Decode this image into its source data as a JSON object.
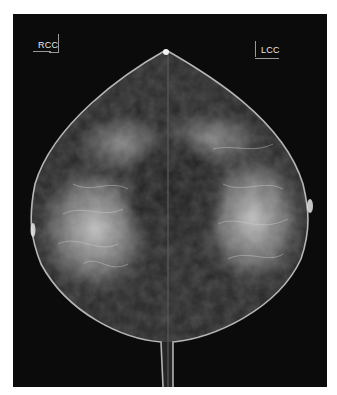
{
  "image": {
    "subject": "bilateral craniocaudal mammogram (mirrored RCC and LCC views)",
    "background_color": "#0b0b0b",
    "page_color": "#ffffff"
  },
  "labels": {
    "right_view": "RCC",
    "left_view": "LCC"
  }
}
